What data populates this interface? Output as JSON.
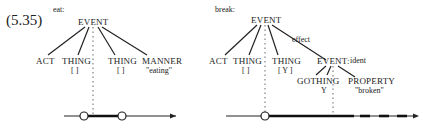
{
  "example_number": "(5.35)",
  "left": {
    "verb_label": "eat:",
    "root": "EVENT",
    "children": [
      {
        "label": "ACT",
        "sub": ""
      },
      {
        "label": "THING",
        "sub": "[ ]"
      },
      {
        "label": "THING",
        "sub": "[ ]"
      },
      {
        "label": "MANNER",
        "sub": "\"eating\""
      }
    ],
    "timeline": {
      "circles": 2,
      "segment": "bold between circles",
      "arrow": true
    }
  },
  "right": {
    "verb_label": "break:",
    "root": "EVENT",
    "edge_label": "effect",
    "children": [
      {
        "label": "ACT",
        "sub": "[ ]"
      },
      {
        "label": "THING",
        "sub": "[ ]"
      },
      {
        "label": "THING",
        "sub": "[ Y ]"
      },
      {
        "label": "EVENT:",
        "qualifier": "ident"
      }
    ],
    "sub_children": [
      {
        "label": "GOTHING",
        "sub": "Y"
      },
      {
        "label": "PROPERTY",
        "sub": "\"broken\""
      }
    ],
    "timeline": {
      "circles": 1,
      "segment": "bold then dashed",
      "arrow": true
    }
  }
}
